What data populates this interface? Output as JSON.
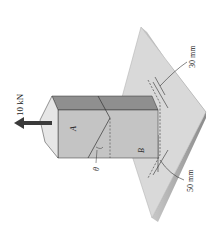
{
  "figure": {
    "load_label": "10 kN",
    "point_a_label": "A",
    "point_b_label": "B",
    "angle_label": "θ",
    "dim_top_label": "30 mm",
    "dim_bottom_label": "50 mm"
  },
  "colors": {
    "background": "#ffffff",
    "plate_top": "#d9d9d9",
    "plate_edge": "#b5b5b5",
    "block_top": "#e6e6e6",
    "block_front": "#c4c4c4",
    "block_side": "#8f8f8f",
    "arrow": "#3a3a3a",
    "line": "#333333"
  }
}
